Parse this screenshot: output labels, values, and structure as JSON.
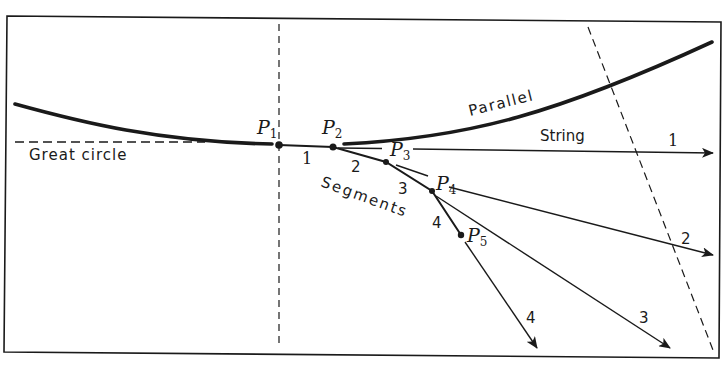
{
  "figure": {
    "labels": {
      "great_circle": "Great circle",
      "parallel": "Parallel",
      "string": "String",
      "segments": "Segments"
    },
    "points": [
      {
        "name": "P",
        "sub": "1"
      },
      {
        "name": "P",
        "sub": "2"
      },
      {
        "name": "P",
        "sub": "3"
      },
      {
        "name": "P",
        "sub": "4"
      },
      {
        "name": "P",
        "sub": "5"
      }
    ],
    "segment_numbers": [
      "1",
      "2",
      "3",
      "4"
    ],
    "string_numbers": [
      "1",
      "2",
      "3",
      "4"
    ],
    "colors": {
      "ink": "#1a1a1a",
      "background": "#ffffff"
    }
  }
}
